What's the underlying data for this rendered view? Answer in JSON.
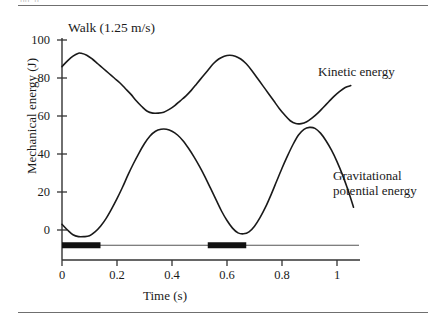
{
  "figure": {
    "top_cut_text": "pp. p",
    "title": "Walk (1.25 m/s)"
  },
  "annotations": {
    "kinetic": "Kinetic energy",
    "gpe_line1": "Gravitational",
    "gpe_line2": "potential energy"
  },
  "axes": {
    "ylabel": "Mechanical energy (J)",
    "xlabel": "Time (s)",
    "yticks": [
      "100",
      "80",
      "60",
      "40",
      "20",
      "0"
    ],
    "xticks": [
      "0",
      "0.2",
      "0.4",
      "0.6",
      "0.8",
      "1"
    ]
  },
  "chart_data": {
    "type": "line",
    "title": "Walk (1.25 m/s)",
    "xlabel": "Time (s)",
    "ylabel": "Mechanical energy (J)",
    "xlim": [
      0,
      1.08
    ],
    "ylim": [
      -12,
      100
    ],
    "xticks": [
      0,
      0.2,
      0.4,
      0.6,
      0.8,
      1
    ],
    "yticks": [
      0,
      20,
      40,
      60,
      80,
      100
    ],
    "grid": false,
    "legend": "annotated-inline",
    "series": [
      {
        "name": "Kinetic energy",
        "color": "#1a1a1a",
        "x": [
          0.0,
          0.02,
          0.04,
          0.06,
          0.07,
          0.09,
          0.11,
          0.13,
          0.15,
          0.17,
          0.19,
          0.21,
          0.23,
          0.25,
          0.27,
          0.29,
          0.31,
          0.33,
          0.35,
          0.37,
          0.39,
          0.41,
          0.43,
          0.45,
          0.47,
          0.49,
          0.51,
          0.53,
          0.55,
          0.57,
          0.59,
          0.61,
          0.63,
          0.65,
          0.67,
          0.69,
          0.71,
          0.73,
          0.75,
          0.77,
          0.79,
          0.81,
          0.83,
          0.85,
          0.87,
          0.89,
          0.91,
          0.93,
          0.95,
          0.97,
          0.99,
          1.01,
          1.03,
          1.05
        ],
        "y": [
          86,
          89,
          91.5,
          93,
          93,
          92,
          90,
          87.5,
          85,
          82.5,
          80,
          77.5,
          74.5,
          71.5,
          68,
          65,
          62.5,
          61.5,
          61.5,
          62,
          63.5,
          65.5,
          68,
          70.5,
          73.5,
          77,
          80.5,
          84,
          87.5,
          90,
          91.5,
          92,
          91.5,
          90,
          87.5,
          84,
          80,
          76,
          72,
          68,
          64,
          60.5,
          57.5,
          56,
          56,
          57,
          59,
          61.5,
          64.5,
          67.5,
          70.5,
          73,
          75,
          76
        ]
      },
      {
        "name": "Gravitational potential energy",
        "color": "#1a1a1a",
        "x": [
          0.0,
          0.02,
          0.04,
          0.06,
          0.08,
          0.1,
          0.12,
          0.14,
          0.16,
          0.18,
          0.2,
          0.22,
          0.24,
          0.26,
          0.28,
          0.3,
          0.32,
          0.34,
          0.36,
          0.38,
          0.4,
          0.42,
          0.44,
          0.46,
          0.48,
          0.5,
          0.52,
          0.54,
          0.56,
          0.58,
          0.6,
          0.62,
          0.64,
          0.66,
          0.68,
          0.7,
          0.72,
          0.74,
          0.76,
          0.78,
          0.8,
          0.82,
          0.84,
          0.86,
          0.88,
          0.9,
          0.92,
          0.94,
          0.96,
          0.98,
          1.0,
          1.02,
          1.04,
          1.06
        ],
        "y": [
          3,
          0,
          -2.5,
          -3.5,
          -3.5,
          -3,
          -1,
          2,
          6,
          11,
          16.5,
          22.5,
          29,
          35,
          40.5,
          45.5,
          49.5,
          52,
          53,
          53,
          52,
          50,
          47,
          43,
          38.5,
          33.5,
          28,
          22,
          16,
          10,
          5,
          1,
          -1.5,
          -2,
          -1,
          2,
          6.5,
          12,
          18.5,
          25.5,
          32.5,
          39,
          45,
          50,
          53,
          54,
          53.5,
          51,
          47,
          42,
          36,
          29,
          21,
          12
        ]
      }
    ],
    "stance_bars": {
      "description": "Stance-phase indicator bar below the axis",
      "baseline_value": -8,
      "segments": [
        {
          "start": 0.0,
          "end": 0.14
        },
        {
          "start": 0.53,
          "end": 0.67
        }
      ],
      "line_extent": [
        0.0,
        1.08
      ]
    }
  }
}
